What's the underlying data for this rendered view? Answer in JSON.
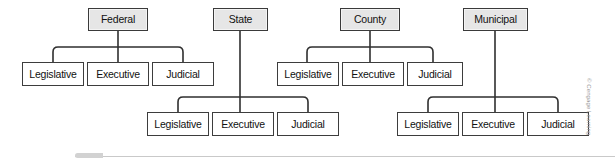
{
  "diagram": {
    "groups": [
      {
        "id": "federal",
        "root_label": "Federal",
        "children": [
          {
            "label": "Legislative"
          },
          {
            "label": "Executive"
          },
          {
            "label": "Judicial"
          }
        ]
      },
      {
        "id": "state",
        "root_label": "State",
        "children": [
          {
            "label": "Legislative"
          },
          {
            "label": "Executive"
          },
          {
            "label": "Judicial"
          }
        ]
      },
      {
        "id": "county",
        "root_label": "County",
        "children": [
          {
            "label": "Legislative"
          },
          {
            "label": "Executive"
          },
          {
            "label": "Judicial"
          }
        ]
      },
      {
        "id": "municipal",
        "root_label": "Municipal",
        "children": [
          {
            "label": "Legislative"
          },
          {
            "label": "Executive"
          },
          {
            "label": "Judicial"
          }
        ]
      }
    ]
  },
  "credit": {
    "text": "© Cengage Learning"
  },
  "colors": {
    "root_fill": "#e6e6e6",
    "child_fill": "#ffffff",
    "border": "#3a3a3a",
    "connector": "#2f2f2f",
    "rule": "#c9c9c9",
    "credit": "#9a9a9a"
  }
}
